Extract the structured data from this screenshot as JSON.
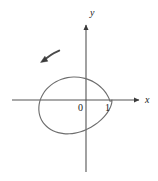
{
  "figure": {
    "title": "",
    "background_color": "#ffffff",
    "curve_color": "#666666",
    "axis_color": "#555555",
    "text_color": "#1a1a1a"
  },
  "axes": {
    "x_axis_label": "x",
    "y_axis_label": "y",
    "origin_label": "0",
    "x_tick_labels": [
      "1"
    ],
    "y_tick_labels": [],
    "x_arrow": "arrow-right",
    "y_arrow": "arrow-up"
  },
  "annotations": {
    "direction_arrow": "counterclockwise-direction-arrow"
  },
  "chart_data": {
    "type": "line",
    "title": "",
    "xlabel": "x",
    "ylabel": "y",
    "grid": false,
    "legend": null,
    "curve_name": "cardioid",
    "polar_equation": "r = 1 - cos(theta)",
    "cusp_point": [
      1,
      0
    ],
    "leftmost_point": [
      -2,
      0
    ],
    "xlim": [
      -2.6,
      2.0
    ],
    "ylim": [
      -2.0,
      2.0
    ],
    "x_tick_values": [
      0,
      1
    ],
    "y_tick_values": [],
    "orientation": "counterclockwise",
    "points": [
      [
        1.0,
        0.0
      ],
      [
        0.991,
        -0.1
      ],
      [
        0.964,
        -0.206
      ],
      [
        0.918,
        -0.318
      ],
      [
        0.852,
        -0.437
      ],
      [
        0.764,
        -0.561
      ],
      [
        0.654,
        -0.688
      ],
      [
        0.521,
        -0.814
      ],
      [
        0.366,
        -0.935
      ],
      [
        0.191,
        -1.046
      ],
      [
        0.0,
        -1.142
      ],
      [
        -0.205,
        -1.22
      ],
      [
        -0.42,
        -1.273
      ],
      [
        -0.64,
        -1.299
      ],
      [
        -0.859,
        -1.294
      ],
      [
        -1.07,
        -1.256
      ],
      [
        -1.268,
        -1.184
      ],
      [
        -1.443,
        -1.078
      ],
      [
        -1.591,
        -0.941
      ],
      [
        -1.705,
        -0.777
      ],
      [
        -1.78,
        -0.59
      ],
      [
        -1.814,
        -0.387
      ],
      [
        -1.803,
        -0.177
      ],
      [
        -1.749,
        0.032
      ],
      [
        -1.652,
        0.232
      ],
      [
        -1.518,
        0.415
      ],
      [
        -1.35,
        0.574
      ],
      [
        -1.155,
        0.703
      ],
      [
        -0.941,
        0.799
      ],
      [
        -0.716,
        0.859
      ],
      [
        -0.487,
        0.884
      ],
      [
        -0.263,
        0.874
      ],
      [
        -0.049,
        0.833
      ],
      [
        0.148,
        0.765
      ],
      [
        0.327,
        0.674
      ],
      [
        0.484,
        0.566
      ],
      [
        0.617,
        0.447
      ],
      [
        0.727,
        0.322
      ],
      [
        0.814,
        0.195
      ],
      [
        0.879,
        0.072
      ],
      [
        0.925,
        -0.044
      ],
      [
        1.0,
        0.0
      ]
    ]
  }
}
